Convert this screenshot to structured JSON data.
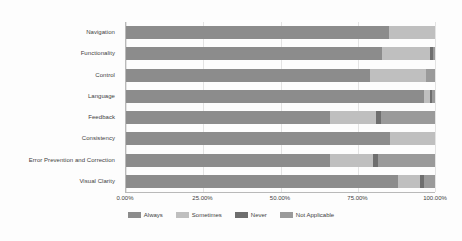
{
  "chart_data": {
    "type": "bar",
    "orientation": "horizontal",
    "stacked": true,
    "normalized": true,
    "title": "",
    "subtitle": "",
    "xlabel": "",
    "ylabel": "",
    "xlim": [
      0,
      100
    ],
    "xticks": [
      0,
      25,
      50,
      75,
      100
    ],
    "xtick_labels": [
      "0.00%",
      "25.00%",
      "50.00%",
      "75.00%",
      "100.00%"
    ],
    "grid": true,
    "grid_axis": "x",
    "legend_position": "bottom",
    "categories": [
      "Navigation",
      "Functionality",
      "Control",
      "Language",
      "Feedback",
      "Consistency",
      "Error Prevention and Correction",
      "Visual Clarity"
    ],
    "series": [
      {
        "name": "Always",
        "color": "#8c8c8c",
        "values": [
          85.0,
          83.0,
          79.0,
          96.5,
          66.0,
          85.5,
          66.0,
          88.0
        ]
      },
      {
        "name": "Sometimes",
        "color": "#bfbfbf",
        "values": [
          15.0,
          15.5,
          18.0,
          2.0,
          15.0,
          14.5,
          14.0,
          7.0
        ]
      },
      {
        "name": "Never",
        "color": "#6e6e6e",
        "values": [
          0.0,
          1.0,
          0.0,
          0.5,
          1.5,
          0.0,
          1.5,
          1.5
        ]
      },
      {
        "name": "Not Applicable",
        "color": "#9a9a9a",
        "values": [
          0.0,
          0.5,
          3.0,
          1.0,
          17.5,
          0.0,
          18.5,
          3.5
        ]
      }
    ]
  },
  "legend": {
    "items": [
      {
        "label": "Always",
        "color": "#8c8c8c"
      },
      {
        "label": "Sometimes",
        "color": "#bfbfbf"
      },
      {
        "label": "Never",
        "color": "#6e6e6e"
      },
      {
        "label": "Not Applicable",
        "color": "#9a9a9a"
      }
    ]
  },
  "colors": {
    "background": "#fdfdfd",
    "axis": "#b9b9b9",
    "gridline": "#e3e3e3",
    "text": "#3d3d3d"
  }
}
